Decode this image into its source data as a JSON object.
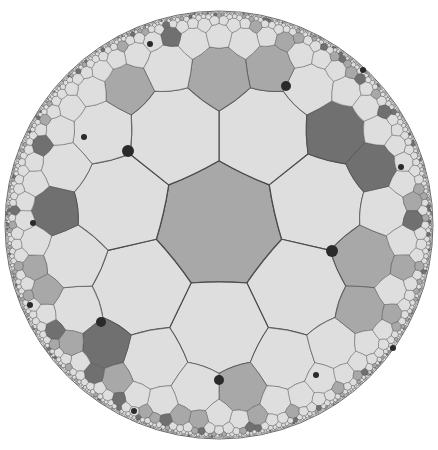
{
  "diagram": {
    "title": "Hyperbolic {7,3} tiling in the Poincaré disk",
    "type": "heptagonal tiling",
    "schlafli": [
      7,
      3
    ],
    "disk": {
      "cx": 219,
      "cy": 225,
      "r": 214
    },
    "central_rotation_deg": -90,
    "max_depth": 6,
    "colors": {
      "background": "#ffffff",
      "edge": "#4a4a4a",
      "light": "#dedede",
      "medium": "#a8a8a8",
      "dark": "#707070",
      "dot": "#2a2a2a"
    },
    "center_tile_color": "medium",
    "dots": [
      {
        "x": 128,
        "y": 151,
        "r": 6
      },
      {
        "x": 286,
        "y": 86,
        "r": 5
      },
      {
        "x": 332,
        "y": 251,
        "r": 6
      },
      {
        "x": 101,
        "y": 322,
        "r": 5
      },
      {
        "x": 219,
        "y": 380,
        "r": 5
      },
      {
        "x": 150,
        "y": 44,
        "r": 3
      },
      {
        "x": 84,
        "y": 137,
        "r": 3
      },
      {
        "x": 33,
        "y": 223,
        "r": 3
      },
      {
        "x": 401,
        "y": 167,
        "r": 3
      },
      {
        "x": 363,
        "y": 70,
        "r": 3
      },
      {
        "x": 316,
        "y": 375,
        "r": 3
      },
      {
        "x": 393,
        "y": 348,
        "r": 3
      },
      {
        "x": 134,
        "y": 411,
        "r": 3
      },
      {
        "x": 30,
        "y": 305,
        "r": 3
      }
    ]
  }
}
